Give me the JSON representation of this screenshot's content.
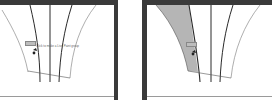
{
  "panels": [
    {
      "id": "before",
      "tooltip": "Click to make a Live Paint group",
      "cursor_tag": "",
      "caption": "",
      "fill_color": null
    },
    {
      "id": "after",
      "tooltip": "",
      "cursor_tag": "",
      "caption": "",
      "fill_color": "#b5b5b5"
    }
  ],
  "colors": {
    "frame": "#3a3a3a",
    "stroke": "#2a2a2a",
    "thin_stroke": "#777777",
    "fill": "#b5b5b5",
    "background": "#ffffff"
  }
}
